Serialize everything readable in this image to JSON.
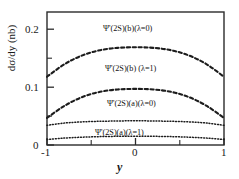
{
  "chart_data": {
    "type": "line",
    "title": "",
    "subtitle": "",
    "xlabel": "y",
    "ylabel": "dσ/dy (nb)",
    "xlim": [
      -1,
      1
    ],
    "ylim": [
      0,
      0.23
    ],
    "grid": false,
    "legend_position": "inline-annotations",
    "x_ticks_major": [
      -1,
      0,
      1
    ],
    "x_tick_labels": [
      "-1",
      "0",
      "1"
    ],
    "x_ticks_minor": [
      -0.5,
      0.5
    ],
    "y_ticks_major": [
      0,
      0.1,
      0.2
    ],
    "y_tick_labels": [
      "0",
      "0.1",
      "0.2"
    ],
    "y_ticks_minor": [
      0.05,
      0.15
    ],
    "x": [
      -1,
      -0.8,
      -0.6,
      -0.4,
      -0.2,
      0,
      0.2,
      0.4,
      0.6,
      0.8,
      1
    ],
    "series": [
      {
        "name": "Ψ'(2S)(b)(λ=0)",
        "style": "dashed",
        "values": [
          0.118,
          0.14,
          0.155,
          0.164,
          0.168,
          0.169,
          0.168,
          0.164,
          0.155,
          0.14,
          0.118
        ]
      },
      {
        "name": "Ψ'(2S)(b) (λ=1)",
        "style": "dashed",
        "values": [
          0.047,
          0.068,
          0.083,
          0.092,
          0.096,
          0.097,
          0.096,
          0.092,
          0.083,
          0.068,
          0.047
        ]
      },
      {
        "name": "Ψ'(2S)(a)(λ=0)",
        "style": "dotted",
        "values": [
          0.034,
          0.038,
          0.04,
          0.041,
          0.0415,
          0.042,
          0.0415,
          0.041,
          0.04,
          0.038,
          0.034
        ]
      },
      {
        "name": "Ψ'(2S)(a)(λ=1)",
        "style": "dotted",
        "values": [
          0.0095,
          0.012,
          0.0135,
          0.0145,
          0.015,
          0.0152,
          0.015,
          0.0145,
          0.0135,
          0.012,
          0.0095
        ]
      }
    ]
  },
  "axes": {
    "y_label": "dσ/dy (nb)",
    "x_label": "y",
    "y_tick_0": "0",
    "y_tick_1": "0.1",
    "y_tick_2": "0.2",
    "x_tick_0": "-1",
    "x_tick_1": "0",
    "x_tick_2": "1"
  },
  "annotations": {
    "curve_b_lambda0": "Ψ'(2S)(b)(λ=0)",
    "curve_b_lambda1": "Ψ'(2S)(b) (λ=1)",
    "curve_a_lambda0": "Ψ'(2S)(a)(λ=0)",
    "curve_a_lambda1": "Ψ'(2S)(a)(λ=1)"
  },
  "colors": {
    "axis": "#2b2b2b",
    "curve": "#1c1c1c",
    "background": "#ffffff"
  }
}
